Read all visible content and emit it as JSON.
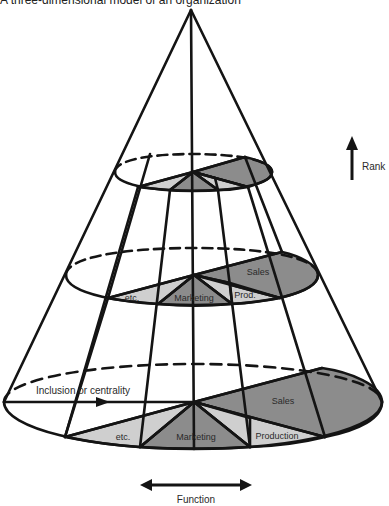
{
  "title": "A three-dimensional model of an organization",
  "axes": {
    "rank_label": "Rank",
    "function_label": "Function",
    "inclusion_label": "Inclusion or centrality"
  },
  "levels": {
    "top": {
      "segments": []
    },
    "middle": {
      "labels": {
        "etc": "etc.",
        "marketing": "Marketing",
        "production": "Prod.",
        "sales": "Sales"
      }
    },
    "bottom": {
      "labels": {
        "etc": "etc.",
        "marketing": "Marketing",
        "production": "Production",
        "sales": "Sales"
      }
    }
  },
  "colors": {
    "line": "#141414",
    "light_fill": "#cfcfcf",
    "dark_fill": "#8c8c8c",
    "background": "#ffffff"
  }
}
